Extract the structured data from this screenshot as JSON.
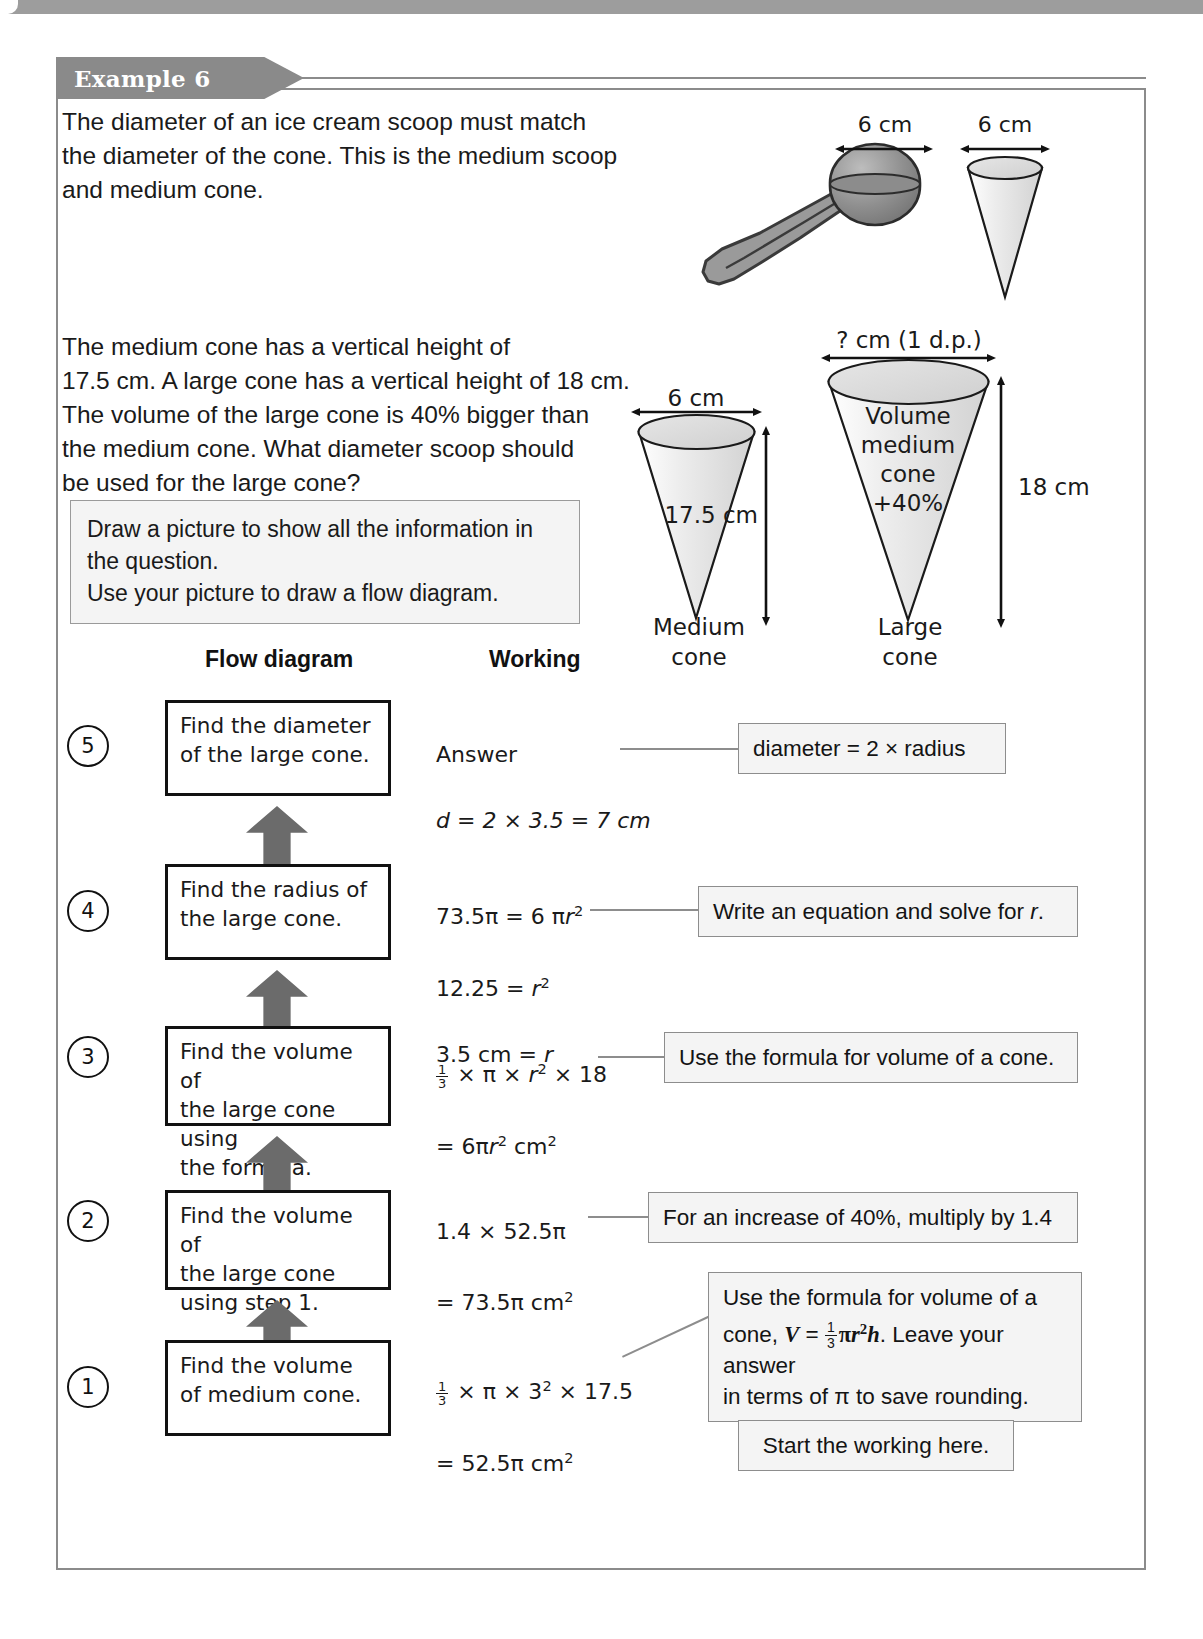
{
  "example": {
    "tag_label": "Example 6",
    "intro_paragraph": "The diameter of an ice cream scoop must match\nthe diameter of the cone. This is the medium scoop\nand medium cone.",
    "question_paragraph": "The medium cone has a vertical height of\n17.5 cm. A large cone has a vertical height of 18 cm.\nThe volume of the large cone is 40% bigger than\nthe medium cone. What diameter scoop should\nbe used for the large cone?",
    "hint_box": "Draw a picture to show all the information in\nthe question.\nUse your picture to draw a flow diagram."
  },
  "columns": {
    "flow_heading": "Flow diagram",
    "working_heading": "Working"
  },
  "scoop_figure": {
    "scoop_dimension": "6 cm",
    "cone_dimension": "6 cm"
  },
  "cones_figure": {
    "medium": {
      "width_label": "6 cm",
      "height_label": "17.5 cm",
      "caption": "Medium\ncone"
    },
    "large": {
      "width_label": "? cm (1 d.p.)",
      "height_label": "18 cm",
      "inner_label": "Volume\nmedium\ncone\n+40%",
      "caption": "Large\ncone"
    }
  },
  "steps": [
    {
      "number": "5",
      "box_text": "Find the diameter\nof the large cone.",
      "working_lines": [
        "Answer",
        "d = 2 × 3.5 = 7 cm"
      ],
      "callout": "diameter = 2 × radius"
    },
    {
      "number": "4",
      "box_text": "Find the radius of\nthe large cone.",
      "working_lines": [
        "73.5π = 6 πr²",
        "12.25 = r²",
        "3.5 cm = r"
      ],
      "callout": "Write an equation and solve for r."
    },
    {
      "number": "3",
      "box_text": "Find the volume of\nthe large cone using\nthe formula.",
      "working_lines": [
        "⅓ × π × r² × 18",
        "= 6πr² cm²"
      ],
      "callout": "Use the formula for volume of a cone."
    },
    {
      "number": "2",
      "box_text": "Find the volume of\nthe large cone\nusing step 1.",
      "working_lines": [
        "1.4 × 52.5π",
        "= 73.5π cm²"
      ],
      "callout": "For an increase of 40%, multiply by 1.4"
    },
    {
      "number": "1",
      "box_text": "Find the volume\nof medium cone.",
      "working_lines": [
        "⅓ × π × 3² × 17.5",
        "= 52.5π cm²"
      ],
      "callout": "Use the formula for volume of a\ncone, V = ⅓πr²h. Leave your answer\nin terms of π to save rounding."
    }
  ],
  "callout_formula": {
    "line1": "Use the formula for volume of a",
    "line2_pre": "cone, ",
    "line2_V": "V",
    "line2_eq": " = ",
    "line2_num": "1",
    "line2_den": "3",
    "line2_post": "πr²h",
    "line2_tail": ". Leave your answer",
    "line3": "in terms of π to save rounding."
  },
  "start_box": "Start the working here."
}
